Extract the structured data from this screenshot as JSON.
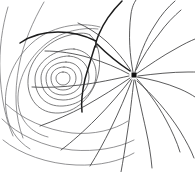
{
  "figure": {
    "width": 195,
    "height": 172,
    "background_color": "#ffffff",
    "line_color": "#4a4a4a",
    "separatrix_color": "#1c1c1c",
    "node_marker_color": "#111111"
  },
  "chart_data": {
    "type": "line",
    "title": "",
    "subtitle": "",
    "xlabel": "",
    "ylabel": "",
    "grid": false,
    "legend": null,
    "xlim": [
      0,
      195
    ],
    "ylim": [
      0,
      172
    ],
    "axis_visible": false,
    "tick_labels": [],
    "annotations": [],
    "critical_points": [
      {
        "name": "center",
        "type": "center",
        "x": 63,
        "y": 78
      },
      {
        "name": "saddle",
        "type": "saddle",
        "x": 97,
        "y": 42
      },
      {
        "name": "node",
        "type": "node",
        "x": 134,
        "y": 75,
        "marker": "filled-square",
        "marker_size": 5
      }
    ],
    "series": [
      {
        "name": "center-loop-1",
        "role": "closed-orbit",
        "path": "M 63 72 C 68 72 70 75 70 78 C 70 82 67 85 63 85 C 59 85 56 82 56 78 C 56 75 59 72 63 72 Z"
      },
      {
        "name": "center-loop-2",
        "role": "closed-orbit",
        "path": "M 64 67 C 72 67 76 72 76 78 C 76 85 71 90 63 90 C 55 90 51 85 51 78 C 51 72 56 67 64 67 Z"
      },
      {
        "name": "center-loop-3",
        "role": "closed-orbit",
        "path": "M 66 62 C 77 62 82 70 82 78 C 82 88 74 95 63 95 C 52 95 46 88 46 78 C 46 69 54 62 66 62 Z"
      },
      {
        "name": "center-loop-4",
        "role": "closed-orbit",
        "path": "M 69 56 C 83 57 89 67 89 77 C 89 90 78 100 63 100 C 49 100 41 91 41 78 C 41 66 54 56 69 56 Z"
      },
      {
        "name": "center-loop-5",
        "role": "closed-orbit",
        "path": "M 74 49 C 90 51 97 64 96 76 C 95 92 81 105 63 106 C 45 107 35 95 35 79 C 35 63 55 48 74 49 Z"
      },
      {
        "name": "center-loop-6-teardrop",
        "role": "closed-orbit",
        "path": "M 90 35 C 98 42 101 56 99 70 C 96 92 79 112 59 113 C 39 114 27 99 28 80 C 29 59 48 40 70 35 C 78 33 85 32 90 35 Z"
      },
      {
        "name": "outer-arc-1",
        "role": "open-orbit",
        "path": "M 98 29 C 83 27 62 31 47 43 C 28 58 17 80 18 101 C 19 120 31 133 48 137"
      },
      {
        "name": "outer-arc-2",
        "role": "open-orbit",
        "path": "M 100 27 C 78 21 50 27 32 43 C 12 61 3 86 6 110 C 8 128 17 141 30 149"
      },
      {
        "name": "sweep-arc-upper-left",
        "role": "open-orbit",
        "path": "M 44 2 C 33 21 23 44 19 66 C 14 92 15 117 23 138"
      },
      {
        "name": "sweep-arc-far-left",
        "role": "open-orbit",
        "path": "M 8 7 C 2 27 -1 50 0 72 C 1 96 5 118 13 136"
      },
      {
        "name": "sweep-arc-lower-1",
        "role": "open-orbit",
        "path": "M 2 119 C 18 135 44 147 72 150 C 96 152 118 148 134 140"
      },
      {
        "name": "sweep-arc-lower-2",
        "role": "open-orbit",
        "path": "M 3 140 C 20 154 48 164 76 165 C 100 166 120 161 134 153"
      },
      {
        "name": "sweep-arc-lower-3",
        "role": "open-orbit",
        "path": "M 6 104 C 22 119 46 130 72 133 C 94 135 114 130 128 121"
      },
      {
        "name": "separatrix-upper-stem",
        "role": "separatrix",
        "path": "M 122 1 C 113 10 104 22 99 34 C 96 41 95 44 96 47"
      },
      {
        "name": "separatrix-saddle-to-node",
        "role": "separatrix",
        "path": "M 97 44 C 106 53 118 63 130 71"
      },
      {
        "name": "separatrix-left-branch",
        "role": "separatrix",
        "path": "M 96 41 C 86 36 72 32 58 32 C 43 32 30 36 20 43"
      },
      {
        "name": "separatrix-lower-branch",
        "role": "separatrix",
        "path": "M 95 46 C 92 56 88 68 85 79 C 82 92 81 103 82 112"
      },
      {
        "name": "ray-1",
        "role": "node-ray",
        "path": "M 133 72 C 130 56 128 36 131 14 C 132 7 134 3 136 0"
      },
      {
        "name": "ray-2",
        "role": "node-ray",
        "path": "M 135 72 C 139 57 145 40 155 25 C 161 15 168 7 175 1"
      },
      {
        "name": "ray-3",
        "role": "node-ray",
        "path": "M 136 74 C 148 66 162 56 177 48 C 184 44 190 41 195 39"
      },
      {
        "name": "ray-4",
        "role": "node-ray",
        "path": "M 137 77 C 150 79 166 83 180 89 C 187 92 192 95 195 97"
      },
      {
        "name": "ray-5",
        "role": "node-ray",
        "path": "M 137 79 C 146 89 157 103 166 120 C 172 131 177 142 180 152"
      },
      {
        "name": "ray-6",
        "role": "node-ray",
        "path": "M 135 80 C 138 94 142 112 146 130 C 149 144 151 156 152 168"
      },
      {
        "name": "ray-7",
        "role": "node-ray",
        "path": "M 134 80 C 132 96 130 116 127 135 C 125 149 123 161 121 172"
      },
      {
        "name": "ray-8",
        "role": "node-ray",
        "path": "M 132 80 C 126 95 119 112 111 128 C 104 142 97 155 90 166"
      },
      {
        "name": "ray-9",
        "role": "node-ray",
        "path": "M 131 79 C 121 92 109 106 96 119 C 84 131 72 142 61 150"
      },
      {
        "name": "ray-10",
        "role": "node-ray",
        "path": "M 130 78 C 117 87 101 97 85 106 C 70 114 54 121 40 126"
      },
      {
        "name": "ray-11",
        "role": "node-ray",
        "path": "M 129 76 C 115 79 97 83 80 85 C 63 87 46 88 32 87"
      },
      {
        "name": "ray-12",
        "role": "node-ray",
        "path": "M 129 74 C 118 68 104 62 90 58 C 74 53 58 51 45 51"
      },
      {
        "name": "ray-13",
        "role": "node-ray",
        "path": "M 131 71 C 125 61 116 50 106 41 C 97 33 87 27 78 23"
      },
      {
        "name": "ray-14",
        "role": "node-ray",
        "path": "M 136 70 C 142 58 150 45 159 34 C 166 24 174 16 181 10"
      },
      {
        "name": "ray-15",
        "role": "node-ray",
        "path": "M 137 81 C 152 94 168 112 180 131 C 186 141 191 150 194 158"
      },
      {
        "name": "ray-16",
        "role": "node-ray",
        "path": "M 138 76 C 154 74 172 72 188 72 C 191 72 193 72 195 72"
      }
    ]
  }
}
